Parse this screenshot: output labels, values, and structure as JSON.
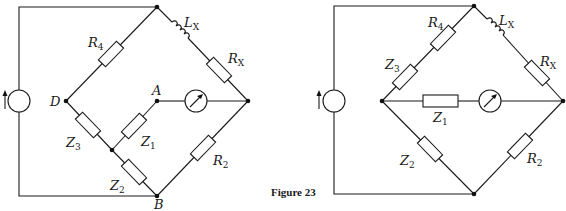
{
  "figure": {
    "caption": "Figure 23"
  },
  "left_circuit": {
    "nodes": {
      "D": "D",
      "A": "A",
      "B": "B"
    },
    "components": {
      "R4": {
        "main": "R",
        "sub": "4"
      },
      "Lx": {
        "main": "L",
        "sub": "X"
      },
      "Rx": {
        "main": "R",
        "sub": "X"
      },
      "Z3": {
        "main": "Z",
        "sub": "3"
      },
      "Z1": {
        "main": "Z",
        "sub": "1"
      },
      "Z2": {
        "main": "Z",
        "sub": "2"
      },
      "R2": {
        "main": "R",
        "sub": "2"
      }
    },
    "source": "ac-current-source",
    "detector": "galvanometer"
  },
  "right_circuit": {
    "components": {
      "R4": {
        "main": "R",
        "sub": "4"
      },
      "Lx": {
        "main": "L",
        "sub": "X"
      },
      "Rx": {
        "main": "R",
        "sub": "X"
      },
      "Z3": {
        "main": "Z",
        "sub": "3"
      },
      "Z1": {
        "main": "Z",
        "sub": "1"
      },
      "Z2": {
        "main": "Z",
        "sub": "2"
      },
      "R2": {
        "main": "R",
        "sub": "2"
      }
    },
    "source": "ac-current-source",
    "detector": "galvanometer"
  },
  "colors": {
    "line": "#1a1a1a",
    "background": "#ffffff"
  }
}
